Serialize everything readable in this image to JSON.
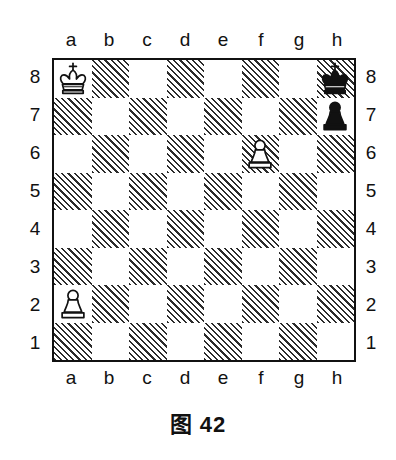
{
  "figure": {
    "caption": "图 42"
  },
  "board": {
    "files": [
      "a",
      "b",
      "c",
      "d",
      "e",
      "f",
      "g",
      "h"
    ],
    "ranks": [
      "8",
      "7",
      "6",
      "5",
      "4",
      "3",
      "2",
      "1"
    ],
    "light_color": "#ffffff",
    "dark_color": "#2b2b2b",
    "border_color": "#111111",
    "orientation": "white-bottom",
    "dark_square_style": "diagonal-hatch",
    "pieces": [
      {
        "square": "a8",
        "piece": "king",
        "color": "white",
        "glyph": "white-king-icon"
      },
      {
        "square": "h8",
        "piece": "king",
        "color": "black",
        "glyph": "black-king-icon"
      },
      {
        "square": "h7",
        "piece": "pawn",
        "color": "black",
        "glyph": "black-pawn-icon"
      },
      {
        "square": "f6",
        "piece": "pawn",
        "color": "white",
        "glyph": "white-pawn-icon"
      },
      {
        "square": "a2",
        "piece": "pawn",
        "color": "white",
        "glyph": "white-pawn-icon"
      }
    ],
    "fen": "K6k/7p/5P2/8/8/8/P7/8"
  }
}
